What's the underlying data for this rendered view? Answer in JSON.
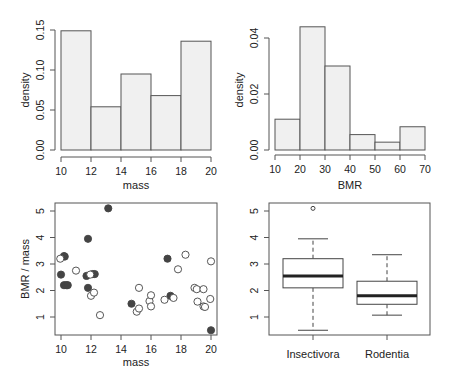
{
  "chart_data": [
    {
      "type": "bar",
      "subtype": "histogram",
      "title": "",
      "xlabel": "mass",
      "ylabel": "density",
      "bins": [
        [
          10,
          12
        ],
        [
          12,
          14
        ],
        [
          14,
          16
        ],
        [
          16,
          18
        ],
        [
          18,
          20
        ]
      ],
      "values": [
        0.149,
        0.054,
        0.095,
        0.068,
        0.136
      ],
      "xticks": [
        "10",
        "12",
        "14",
        "16",
        "18",
        "20"
      ],
      "yticks": [
        "0.00",
        "0.05",
        "0.10",
        "0.15"
      ],
      "xlim": [
        10,
        20
      ],
      "ylim": [
        0,
        0.15
      ],
      "grid": false,
      "fill_color": "#f0f0f0"
    },
    {
      "type": "bar",
      "subtype": "histogram",
      "title": "",
      "xlabel": "BMR",
      "ylabel": "density",
      "bins": [
        [
          10,
          20
        ],
        [
          20,
          30
        ],
        [
          30,
          40
        ],
        [
          40,
          50
        ],
        [
          50,
          60
        ],
        [
          60,
          70
        ]
      ],
      "values": [
        0.011,
        0.044,
        0.03,
        0.0055,
        0.0028,
        0.0083
      ],
      "xticks": [
        "10",
        "20",
        "30",
        "40",
        "50",
        "60",
        "70"
      ],
      "yticks": [
        "0.00",
        "0.02",
        "0.04"
      ],
      "xlim": [
        10,
        70
      ],
      "ylim": [
        0,
        0.044
      ],
      "grid": false,
      "fill_color": "#f0f0f0"
    },
    {
      "type": "scatter",
      "title": "",
      "xlabel": "mass",
      "ylabel": "BMR / mass",
      "xticks": [
        "10",
        "12",
        "14",
        "16",
        "18",
        "20"
      ],
      "yticks": [
        "1",
        "2",
        "3",
        "4",
        "5"
      ],
      "xlim": [
        9.7,
        20.4
      ],
      "ylim": [
        0.3,
        5.3
      ],
      "series": [
        {
          "name": "Insectivora",
          "marker": "filled-circle",
          "color": "#444444",
          "points": [
            [
              10.0,
              2.6
            ],
            [
              10.2,
              3.3
            ],
            [
              10.25,
              3.28
            ],
            [
              10.2,
              2.2
            ],
            [
              10.35,
              2.2
            ],
            [
              10.45,
              2.2
            ],
            [
              11.7,
              2.55
            ],
            [
              11.8,
              3.95
            ],
            [
              11.8,
              2.1
            ],
            [
              12.1,
              2.62
            ],
            [
              12.25,
              2.62
            ],
            [
              13.15,
              5.1
            ],
            [
              14.7,
              1.5
            ],
            [
              17.1,
              3.2
            ],
            [
              17.3,
              1.8
            ],
            [
              20.0,
              0.5
            ]
          ]
        },
        {
          "name": "Rodentia",
          "marker": "open-circle",
          "color": "#444444",
          "points": [
            [
              9.95,
              3.2
            ],
            [
              11.0,
              2.75
            ],
            [
              11.95,
              2.6
            ],
            [
              12.0,
              1.8
            ],
            [
              12.2,
              1.92
            ],
            [
              12.6,
              1.07
            ],
            [
              15.05,
              1.2
            ],
            [
              15.2,
              1.32
            ],
            [
              15.2,
              2.1
            ],
            [
              15.9,
              1.6
            ],
            [
              16.0,
              1.82
            ],
            [
              16.0,
              1.4
            ],
            [
              16.9,
              1.65
            ],
            [
              17.5,
              1.72
            ],
            [
              17.8,
              2.8
            ],
            [
              18.3,
              3.35
            ],
            [
              18.9,
              2.1
            ],
            [
              19.05,
              2.05
            ],
            [
              19.1,
              1.58
            ],
            [
              19.5,
              2.05
            ],
            [
              19.5,
              1.4
            ],
            [
              19.6,
              1.38
            ],
            [
              19.95,
              1.68
            ],
            [
              20.0,
              3.1
            ]
          ]
        }
      ],
      "grid": false
    },
    {
      "type": "box",
      "title": "",
      "xlabel": "",
      "ylabel": "",
      "categories": [
        "Insectivora",
        "Rodentia"
      ],
      "yticks": [
        "1",
        "2",
        "3",
        "4",
        "5"
      ],
      "ylim": [
        0.3,
        5.3
      ],
      "boxes": [
        {
          "name": "Insectivora",
          "whisker_low": 0.5,
          "q1": 2.1,
          "median": 2.55,
          "q3": 3.2,
          "whisker_high": 3.95,
          "outliers": [
            5.1
          ]
        },
        {
          "name": "Rodentia",
          "whisker_low": 1.07,
          "q1": 1.48,
          "median": 1.8,
          "q3": 2.35,
          "whisker_high": 3.35,
          "outliers": []
        }
      ],
      "grid": false
    }
  ]
}
